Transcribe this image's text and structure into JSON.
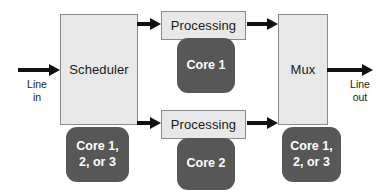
{
  "diagram": {
    "colors": {
      "block_fill": "#e8e8e8",
      "block_border": "#8a8a8a",
      "core_fill": "#575757",
      "core_text": "#ffffff",
      "arrow": "#111111",
      "background": "#ffffff"
    },
    "blocks": [
      {
        "id": "scheduler",
        "label": "Scheduler"
      },
      {
        "id": "processing-top",
        "label": "Processing"
      },
      {
        "id": "processing-bottom",
        "label": "Processing"
      },
      {
        "id": "mux",
        "label": "Mux"
      }
    ],
    "cores": [
      {
        "id": "core-scheduler",
        "line1": "Core 1,",
        "line2": "2, or 3"
      },
      {
        "id": "core-top",
        "line1": "Core 1",
        "line2": ""
      },
      {
        "id": "core-bottom",
        "line1": "Core 2",
        "line2": ""
      },
      {
        "id": "core-mux",
        "line1": "Core 1,",
        "line2": "2, or 3"
      }
    ],
    "labels": {
      "line_in_1": "Line",
      "line_in_2": "in",
      "line_out_1": "Line",
      "line_out_2": "out"
    },
    "arrows": [
      {
        "id": "input-arrow",
        "from": "line-in",
        "to": "scheduler"
      },
      {
        "id": "scheduler-to-top-arrow",
        "from": "scheduler",
        "to": "processing-top"
      },
      {
        "id": "scheduler-to-bottom-arrow",
        "from": "scheduler",
        "to": "processing-bottom"
      },
      {
        "id": "top-to-mux-arrow",
        "from": "processing-top",
        "to": "mux"
      },
      {
        "id": "bottom-to-mux-arrow",
        "from": "processing-bottom",
        "to": "mux"
      },
      {
        "id": "output-arrow",
        "from": "mux",
        "to": "line-out"
      }
    ]
  }
}
